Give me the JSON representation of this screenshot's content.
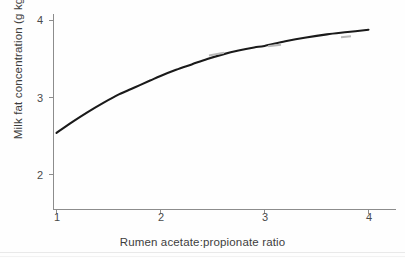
{
  "figure": {
    "background_color": "#fefefe",
    "curve_color": "#1a1a1a",
    "axis_color": "#8c8c8c",
    "text_color": "#3d3d3d"
  },
  "axes": {
    "x_title": "Rumen acetate:propionate ratio",
    "y_title_main": "Milk fat concentration (g kg",
    "y_title_sup": "−1",
    "y_title_tail": ")",
    "x_ticks": [
      "1",
      "2",
      "3",
      "4"
    ],
    "y_ticks": [
      "2",
      "3",
      "4"
    ]
  },
  "chart_data": {
    "type": "line",
    "title": "",
    "subtitle": "",
    "xlabel": "Rumen acetate:propionate ratio",
    "ylabel": "Milk fat concentration (g kg−1)",
    "xlim": [
      0.95,
      4.12
    ],
    "ylim": [
      1.5,
      4.15
    ],
    "xticks": [
      1,
      2,
      3,
      4
    ],
    "yticks": [
      2,
      3,
      4
    ],
    "grid": false,
    "legend": null,
    "annotations": [],
    "series": [
      {
        "name": "Milk fat concentration",
        "color": "#1a1a1a",
        "line_width": 2.1,
        "x": [
          1.0,
          1.15,
          1.3,
          1.45,
          1.6,
          1.75,
          1.9,
          2.0,
          2.15,
          2.3,
          2.45,
          2.6,
          2.75,
          2.9,
          3.0,
          3.2,
          3.4,
          3.6,
          3.8,
          4.0
        ],
        "y": [
          2.54,
          2.68,
          2.81,
          2.93,
          3.04,
          3.13,
          3.22,
          3.28,
          3.36,
          3.43,
          3.5,
          3.56,
          3.61,
          3.65,
          3.67,
          3.73,
          3.78,
          3.82,
          3.85,
          3.88
        ]
      }
    ],
    "key_points": {
      "x1": 2.54,
      "x2": 3.29,
      "x3": 3.67,
      "x4": 3.88
    }
  }
}
